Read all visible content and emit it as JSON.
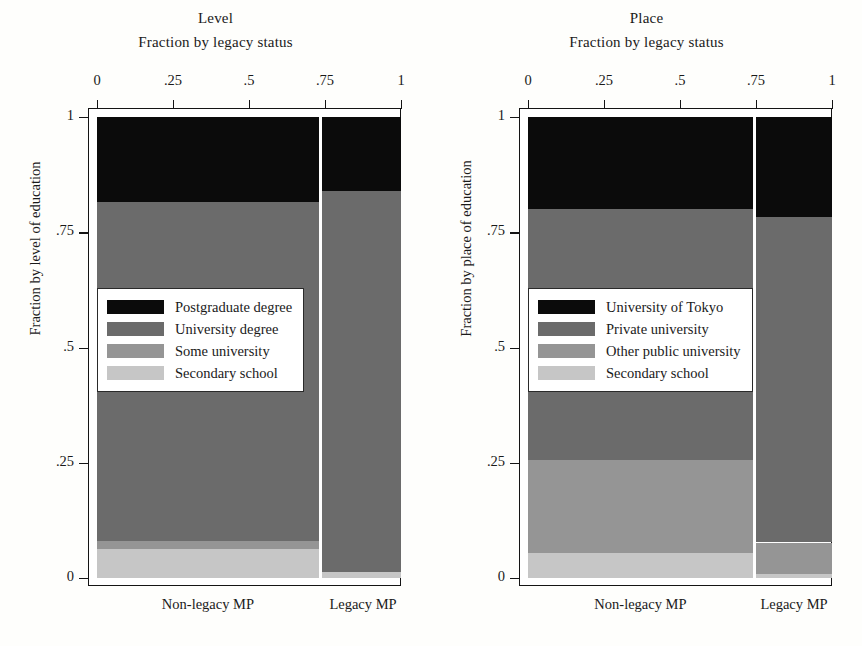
{
  "chart_data": [
    {
      "type": "bar",
      "variant": "mosaic-stacked-100pct",
      "title": "Level",
      "subtitle": "Fraction by legacy status",
      "xlabel": "",
      "ylabel": "Fraction by level of education",
      "xlim": [
        0,
        1
      ],
      "ylim": [
        0,
        1
      ],
      "xticks": [
        "0",
        ".25",
        ".5",
        ".75",
        "1"
      ],
      "xtick_values": [
        0,
        0.25,
        0.5,
        0.75,
        1
      ],
      "yticks": [
        "0",
        ".25",
        ".5",
        ".75",
        "1"
      ],
      "ytick_values": [
        0,
        0.25,
        0.5,
        0.75,
        1
      ],
      "grid": false,
      "legend_position": "center-left",
      "categories": [
        "Non-legacy MP",
        "Legacy MP"
      ],
      "category_widths": [
        0.73,
        0.26
      ],
      "series": [
        {
          "name": "Postgraduate degree",
          "color": "#0b0b0b",
          "values": [
            0.185,
            0.16
          ]
        },
        {
          "name": "University degree",
          "color": "#6b6b6b",
          "values": [
            0.735,
            0.828
          ]
        },
        {
          "name": "Some university",
          "color": "#959595",
          "values": [
            0.018,
            0.0
          ]
        },
        {
          "name": "Secondary school",
          "color": "#c6c6c6",
          "values": [
            0.062,
            0.012
          ]
        }
      ]
    },
    {
      "type": "bar",
      "variant": "mosaic-stacked-100pct",
      "title": "Place",
      "subtitle": "Fraction by legacy status",
      "xlabel": "",
      "ylabel": "Fraction by place of education",
      "xlim": [
        0,
        1
      ],
      "ylim": [
        0,
        1
      ],
      "xticks": [
        "0",
        ".25",
        ".5",
        ".75",
        "1"
      ],
      "xtick_values": [
        0,
        0.25,
        0.5,
        0.75,
        1
      ],
      "yticks": [
        "0",
        ".25",
        ".5",
        ".75",
        "1"
      ],
      "ytick_values": [
        0,
        0.25,
        0.5,
        0.75,
        1
      ],
      "grid": false,
      "legend_position": "center-left",
      "categories": [
        "Non-legacy MP",
        "Legacy MP"
      ],
      "category_widths": [
        0.74,
        0.25
      ],
      "series": [
        {
          "name": "University of Tokyo",
          "color": "#0b0b0b",
          "values": [
            0.2,
            0.218
          ]
        },
        {
          "name": "Private university",
          "color": "#6b6b6b",
          "values": [
            0.545,
            0.705
          ]
        },
        {
          "name": "Other public university",
          "color": "#959595",
          "values": [
            0.2,
            0.068
          ]
        },
        {
          "name": "Secondary school",
          "color": "#c6c6c6",
          "values": [
            0.055,
            0.009
          ]
        }
      ]
    }
  ],
  "panels": [
    {
      "title": "Level",
      "subtitle": "Fraction by legacy status",
      "yaxis_title": "Fraction by level of education",
      "xticks": [
        {
          "label": "0",
          "pos": 0
        },
        {
          "label": ".25",
          "pos": 0.25
        },
        {
          "label": ".5",
          "pos": 0.5
        },
        {
          "label": ".75",
          "pos": 0.75
        },
        {
          "label": "1",
          "pos": 1
        }
      ],
      "yticks": [
        {
          "label": "1",
          "pos": 1
        },
        {
          "label": ".75",
          "pos": 0.75
        },
        {
          "label": ".5",
          "pos": 0.5
        },
        {
          "label": ".25",
          "pos": 0.25
        },
        {
          "label": "0",
          "pos": 0
        }
      ],
      "categories": [
        {
          "label": "Non-legacy MP",
          "center": 0.365
        },
        {
          "label": "Legacy MP",
          "center": 0.875
        }
      ],
      "legend": [
        {
          "label": "Postgraduate degree",
          "color": "#0b0b0b"
        },
        {
          "label": "University degree",
          "color": "#6b6b6b"
        },
        {
          "label": "Some university",
          "color": "#959595"
        },
        {
          "label": "Secondary school",
          "color": "#c6c6c6"
        }
      ]
    },
    {
      "title": "Place",
      "subtitle": "Fraction by legacy status",
      "yaxis_title": "Fraction by place of education",
      "xticks": [
        {
          "label": "0",
          "pos": 0
        },
        {
          "label": ".25",
          "pos": 0.25
        },
        {
          "label": ".5",
          "pos": 0.5
        },
        {
          "label": ".75",
          "pos": 0.75
        },
        {
          "label": "1",
          "pos": 1
        }
      ],
      "yticks": [
        {
          "label": "1",
          "pos": 1
        },
        {
          "label": ".75",
          "pos": 0.75
        },
        {
          "label": ".5",
          "pos": 0.5
        },
        {
          "label": ".25",
          "pos": 0.25
        },
        {
          "label": "0",
          "pos": 0
        }
      ],
      "categories": [
        {
          "label": "Non-legacy MP",
          "center": 0.37
        },
        {
          "label": "Legacy MP",
          "center": 0.875
        }
      ],
      "legend": [
        {
          "label": "University of Tokyo",
          "color": "#0b0b0b"
        },
        {
          "label": "Private university",
          "color": "#6b6b6b"
        },
        {
          "label": "Other public university",
          "color": "#959595"
        },
        {
          "label": "Secondary school",
          "color": "#c6c6c6"
        }
      ]
    }
  ]
}
